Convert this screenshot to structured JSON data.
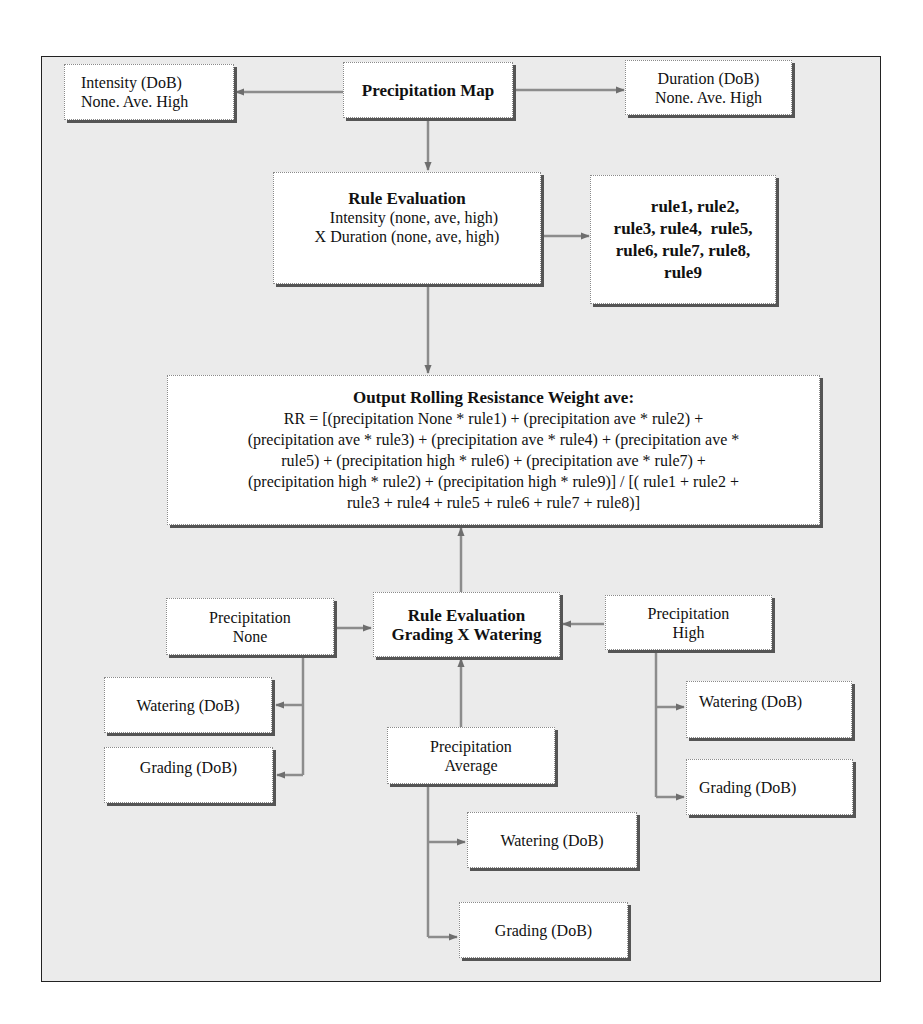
{
  "diagram": {
    "precipitation_map": {
      "label": "Precipitation Map"
    },
    "intensity": {
      "line1": "Intensity (DoB)",
      "line2": "None. Ave. High"
    },
    "duration": {
      "line1": "Duration (DoB)",
      "line2": "None. Ave. High"
    },
    "rule_evaluation_1": {
      "title": "Rule Evaluation",
      "line1": "Intensity (none, ave, high)",
      "line2": "X Duration (none, ave, high)"
    },
    "rules_list": {
      "lines": [
        "rule1, rule2,",
        "rule3, rule4,  rule5,",
        "rule6, rule7, rule8,",
        "rule9"
      ]
    },
    "output": {
      "title": "Output Rolling Resistance Weight ave:",
      "lines": [
        "RR = [(precipitation None * rule1) + (precipitation ave * rule2) +",
        "(precipitation ave * rule3) + (precipitation ave * rule4) + (precipitation ave *",
        "rule5) + (precipitation high * rule6) + (precipitation ave * rule7) +",
        "(precipitation high * rule2) + (precipitation high * rule9)] / [( rule1 + rule2 +",
        "rule3 + rule4 + rule5 + rule6 + rule7 + rule8)]"
      ]
    },
    "rule_evaluation_2": {
      "line1": "Rule Evaluation",
      "line2": "Grading X Watering"
    },
    "precip_none": {
      "line1": "Precipitation",
      "line2": "None"
    },
    "precip_high": {
      "line1": "Precipitation",
      "line2": "High"
    },
    "precip_average": {
      "line1": "Precipitation",
      "line2": "Average"
    },
    "watering_none": {
      "label": "Watering (DoB)"
    },
    "grading_none": {
      "label": "Grading (DoB)"
    },
    "watering_high": {
      "label": "Watering (DoB)"
    },
    "grading_high": {
      "label": "Grading (DoB)"
    },
    "watering_average": {
      "label": "Watering (DoB)"
    },
    "grading_average": {
      "label": "Grading (DoB)"
    }
  },
  "colors": {
    "frame_bg": "#ebebeb",
    "connector": "#8c8c8c",
    "arrowhead": "#6e6e6e",
    "shadow": "#555555"
  }
}
